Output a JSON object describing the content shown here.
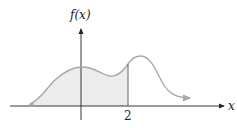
{
  "diagram": {
    "y_axis_label": "f(x)",
    "x_axis_label": "x",
    "x_tick_label": "2",
    "colors": {
      "axis": "#222222",
      "curve": "#a8a8a8",
      "shade": "#ececec",
      "boundary_line": "#555555"
    }
  }
}
